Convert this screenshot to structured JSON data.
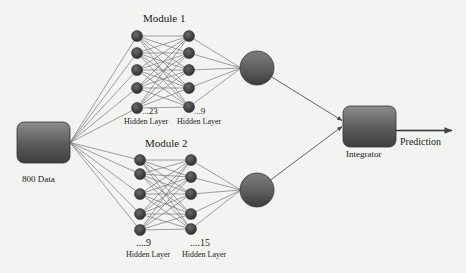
{
  "input": {
    "label": "800 Data",
    "box": {
      "x": 17,
      "y": 122,
      "w": 53,
      "h": 41
    }
  },
  "modules": [
    {
      "title": "Module 1",
      "title_pos": [
        163,
        21
      ],
      "layer1": {
        "x": 137,
        "ys": [
          36,
          53,
          70,
          88,
          108
        ],
        "count_label": "...23",
        "layer_label": "Hidden Layer"
      },
      "layer2": {
        "x": 189,
        "ys": [
          36,
          53,
          70,
          88,
          107
        ],
        "count_label": "...9",
        "layer_label": "Hidden Layer"
      },
      "output_node": {
        "cx": 257,
        "cy": 68,
        "r": 17
      }
    },
    {
      "title": "Module 2",
      "title_pos": [
        166,
        146
      ],
      "layer1": {
        "x": 140,
        "ys": [
          160,
          174,
          194,
          214,
          230
        ],
        "count_label": "....9",
        "layer_label": "Hidden Layer"
      },
      "layer2": {
        "x": 191,
        "ys": [
          160,
          177,
          194,
          214,
          229
        ],
        "count_label": "....15",
        "layer_label": "Hidden Layer"
      },
      "output_node": {
        "cx": 257,
        "cy": 190,
        "r": 17
      }
    }
  ],
  "integrator": {
    "label": "Integrator",
    "box": {
      "x": 343,
      "y": 106,
      "w": 53,
      "h": 41
    }
  },
  "output": {
    "label": "Prediction"
  },
  "colors": {
    "node": "#3a3a3a",
    "box_top": "#8a8a8a",
    "box_bottom": "#404040",
    "edge": "#777777",
    "background": "#f3f3f1"
  }
}
